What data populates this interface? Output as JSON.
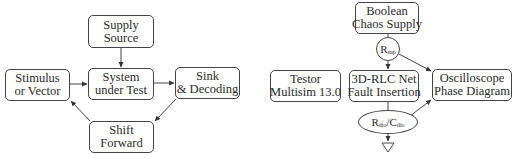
{
  "left_diagram": {
    "nodes": {
      "supply_source": {
        "line1": "Supply",
        "line2": "Source"
      },
      "stimulus": {
        "line1": "Stimulus",
        "line2": "or Vector"
      },
      "sut": {
        "line1": "System",
        "line2": "under Test"
      },
      "sink": {
        "line1": "Sink",
        "line2": "& Decoding"
      },
      "shift": {
        "line1": "Shift",
        "line2": "Forward"
      }
    },
    "edges": [
      {
        "from": "supply_source",
        "to": "sut"
      },
      {
        "from": "stimulus",
        "to": "sut"
      },
      {
        "from": "sut",
        "to": "sink"
      },
      {
        "from": "sink",
        "to": "shift"
      },
      {
        "from": "shift",
        "to": "stimulus"
      }
    ]
  },
  "right_diagram": {
    "nodes": {
      "boolean_supply": {
        "line1": "Boolean",
        "line2": "Chaos Supply"
      },
      "r_sup": {
        "main": "R",
        "sub": "sup"
      },
      "testor": {
        "line1": "Testor",
        "line2": "Multisim 13.0"
      },
      "rlc_net": {
        "line1": "3D-RLC Net",
        "line2": "Fault Insertion"
      },
      "oscilloscope": {
        "line1": "Oscilloscope",
        "line2": "Phase Diagram"
      },
      "r_c_dio": {
        "r": "R",
        "r_sub": "dio",
        "slash": "/",
        "c": "C",
        "c_sub": "dio"
      },
      "ground": {
        "symbol": "ground"
      }
    },
    "edges": [
      {
        "from": "boolean_supply",
        "to": "r_sup"
      },
      {
        "from": "r_sup",
        "to": "rlc_net"
      },
      {
        "from": "r_sup",
        "to": "oscilloscope"
      },
      {
        "from": "rlc_net",
        "to": "r_c_dio"
      },
      {
        "from": "r_c_dio",
        "to": "oscilloscope"
      },
      {
        "from": "r_c_dio",
        "to": "ground"
      }
    ]
  }
}
